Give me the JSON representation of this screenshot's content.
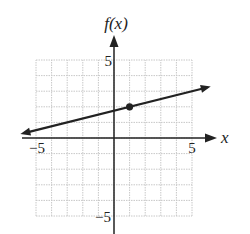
{
  "chart_data": {
    "type": "line",
    "title": "",
    "xlabel": "x",
    "ylabel": "f(x)",
    "xlim": [
      -5,
      5
    ],
    "ylim": [
      -5,
      5
    ],
    "grid": true,
    "grid_step": 1,
    "x_tick_labels": [
      {
        "value": -5,
        "label": "−5"
      },
      {
        "value": 5,
        "label": "5"
      }
    ],
    "y_tick_labels": [
      {
        "value": 5,
        "label": "5"
      },
      {
        "value": -5,
        "label": "−5"
      }
    ],
    "series": [
      {
        "name": "f(x)",
        "equation": "f(x) = 0.25x + 1.75",
        "slope": 0.25,
        "intercept": 1.75,
        "x": [
          -6,
          6.2
        ],
        "y": [
          0.25,
          3.3
        ],
        "arrows_both_ends": true
      }
    ],
    "points": [
      {
        "x": 1,
        "y": 2,
        "style": "filled-dot"
      }
    ],
    "legend": null
  },
  "labels": {
    "x_axis": "x",
    "y_axis": "f(x)",
    "x_min": "−5",
    "x_max": "5",
    "y_max": "5",
    "y_min": "−5"
  },
  "colors": {
    "axis": "#222222",
    "grid": "#c8c8c8",
    "line": "#222222"
  }
}
